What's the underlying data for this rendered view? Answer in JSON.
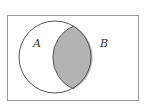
{
  "diagram": {
    "type": "venn",
    "universe": {
      "shape": "rectangle"
    },
    "sets": [
      {
        "label": "A"
      },
      {
        "label": "B"
      }
    ],
    "shaded_region": "A ∩ B",
    "colors": {
      "stroke": "#555555",
      "frame": "#999999",
      "shade": "#b3b3b3",
      "background": "#ffffff"
    }
  }
}
